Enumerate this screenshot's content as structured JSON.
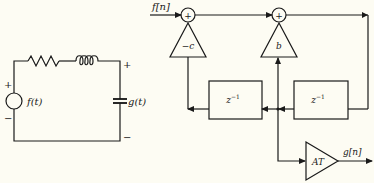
{
  "circuit": {
    "source_label": "f(t)",
    "source_plus": "+",
    "source_minus": "−",
    "output_label": "g(t)",
    "output_plus": "+",
    "output_minus": "−"
  },
  "block_diagram": {
    "input_label": "f[n]",
    "output_label": "g[n]",
    "adder_1_symbol": "+",
    "adder_2_symbol": "+",
    "gain_feedback_label": "−c",
    "gain_feedforward_label": "b",
    "gain_output_label": "AT",
    "delay_1_label": "z",
    "delay_1_exp": "−1",
    "delay_2_label": "z",
    "delay_2_exp": "−1"
  }
}
